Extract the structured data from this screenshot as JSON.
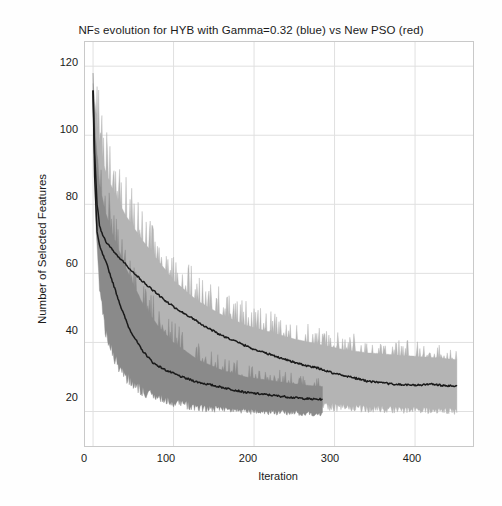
{
  "chart_data": {
    "type": "line",
    "title": "NFs evolution for HYB with Gamma=0.32 (blue) vs New PSO (red)",
    "xlabel": "Iteration",
    "ylabel": "Number of Selected Features",
    "xlim": [
      -10,
      472
    ],
    "ylim": [
      10,
      127
    ],
    "xticks": [
      0,
      100,
      200,
      300,
      400
    ],
    "xtick_labels": [
      "0",
      "100",
      "200",
      "300",
      "400"
    ],
    "yticks": [
      20,
      40,
      60,
      80,
      100,
      120
    ],
    "ytick_labels": [
      "20",
      "40",
      "60",
      "80",
      "100",
      "120"
    ],
    "grid": true,
    "legend_position": "none",
    "legend_in_title": true,
    "series": [
      {
        "name": "HYB with Gamma=0.32 (blue)",
        "color": "#b4b4b4",
        "band_color": "#b4b4b4",
        "mean_color": "#1a1a1a",
        "x_start": 0,
        "x_end": 452,
        "comment": "light gray band = min/max envelope over runs; dark line = mean",
        "mean_x": [
          0,
          2,
          5,
          8,
          12,
          18,
          25,
          35,
          45,
          60,
          75,
          90,
          105,
          120,
          140,
          160,
          180,
          200,
          220,
          240,
          260,
          280,
          300,
          320,
          340,
          360,
          380,
          400,
          420,
          440,
          452
        ],
        "mean_y": [
          113,
          95,
          80,
          74,
          71,
          68.5,
          66.5,
          64,
          61.5,
          58,
          55,
          52,
          49.5,
          47.5,
          44.5,
          42,
          40,
          38,
          36.5,
          35,
          33.5,
          32.5,
          31,
          30,
          28.8,
          28.2,
          27.8,
          27.6,
          27.9,
          27.4,
          27.3
        ],
        "upper_x": [
          0,
          3,
          8,
          15,
          25,
          40,
          60,
          80,
          100,
          130,
          160,
          190,
          220,
          250,
          280,
          310,
          340,
          370,
          400,
          430,
          452
        ],
        "upper_y": [
          115,
          108,
          98,
          90,
          84,
          77,
          70,
          64,
          58,
          52,
          48,
          45,
          43,
          41,
          39.5,
          38,
          37,
          36.5,
          36,
          35.5,
          35
        ],
        "lower_x": [
          0,
          3,
          8,
          15,
          25,
          40,
          60,
          80,
          100,
          130,
          160,
          190,
          220,
          250,
          280,
          310,
          340,
          370,
          400,
          430,
          452
        ],
        "lower_y": [
          111,
          80,
          60,
          48,
          40,
          34,
          30,
          28,
          26.5,
          25,
          24,
          23,
          22.5,
          22,
          21.5,
          21,
          20.8,
          20.5,
          20.3,
          20.2,
          20
        ]
      },
      {
        "name": "New PSO (red)",
        "color": "#8a8a8a",
        "band_color": "#8a8a8a",
        "mean_color": "#1a1a1a",
        "x_start": 0,
        "x_end": 285,
        "comment": "darker gray band = min/max envelope; terminates at iteration ~285",
        "mean_x": [
          0,
          2,
          5,
          8,
          12,
          18,
          25,
          35,
          45,
          60,
          75,
          90,
          110,
          130,
          150,
          170,
          190,
          210,
          230,
          250,
          270,
          285
        ],
        "mean_y": [
          113,
          88,
          72,
          68,
          65.5,
          62,
          57,
          50,
          44,
          38,
          34,
          32,
          30,
          28.5,
          27.5,
          26.5,
          25.5,
          25,
          24.5,
          24,
          23.6,
          23.5
        ],
        "upper_x": [
          0,
          3,
          8,
          15,
          25,
          40,
          60,
          80,
          100,
          130,
          160,
          190,
          220,
          250,
          270,
          285
        ],
        "upper_y": [
          114,
          100,
          86,
          78,
          71,
          62,
          52,
          45,
          40,
          35,
          32,
          30,
          29,
          28,
          27.5,
          27.2
        ],
        "lower_x": [
          0,
          3,
          8,
          15,
          25,
          40,
          60,
          80,
          100,
          130,
          160,
          190,
          220,
          250,
          270,
          285
        ],
        "lower_y": [
          111,
          76,
          56,
          44,
          36,
          30,
          26,
          24,
          22.5,
          21,
          20.5,
          20,
          19.8,
          19.5,
          19.3,
          19.2
        ]
      }
    ],
    "noise": {
      "description": "both envelopes are highly jagged/spiky with per-iteration variation",
      "blue_spike_amplitude": 8,
      "red_spike_amplitude": 6
    }
  },
  "axes": {
    "title": "NFs evolution for HYB with Gamma=0.32 (blue) vs New PSO (red)",
    "xlabel": "Iteration",
    "ylabel": "Number of Selected Features",
    "xtick_labels": [
      "0",
      "100",
      "200",
      "300",
      "400"
    ],
    "ytick_labels": [
      "20",
      "40",
      "60",
      "80",
      "100",
      "120"
    ]
  },
  "colors": {
    "background": "#ffffff",
    "axis": "#c9c9c9",
    "grid": "#e0e0e0",
    "text": "#1a1a1a",
    "band_light": "#b4b4b4",
    "band_dark": "#8a8a8a",
    "mean_line": "#1a1a1a"
  }
}
